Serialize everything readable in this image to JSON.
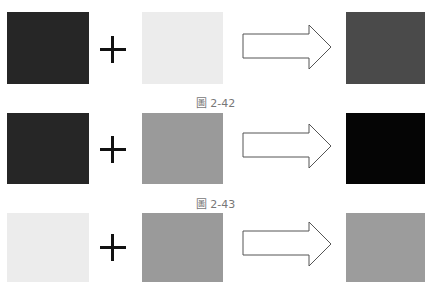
{
  "rows": [
    {
      "left_color": "#262626",
      "middle_color": "#ececec",
      "result_color": "#4a4a4a",
      "caption": "圖 2-42"
    },
    {
      "left_color": "#262626",
      "middle_color": "#9a9a9a",
      "result_color": "#050505",
      "caption": "圖 2-43"
    },
    {
      "left_color": "#ececec",
      "middle_color": "#9a9a9a",
      "result_color": "#9c9c9c",
      "caption": ""
    }
  ],
  "operator_symbol": "plus-icon",
  "result_symbol": "arrow-right-icon"
}
